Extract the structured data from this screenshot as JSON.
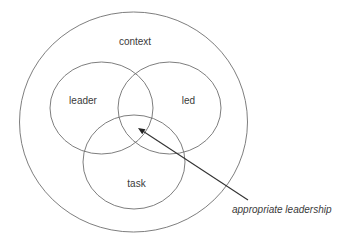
{
  "diagram": {
    "type": "venn",
    "colors": {
      "stroke": "#6f6f6f",
      "text": "#3a3a3a",
      "arrow": "#333333",
      "background": "#ffffff"
    },
    "outer": {
      "label": "context",
      "cx": 133.5,
      "cy": 122,
      "rx": 114,
      "ry": 110,
      "label_x": 135,
      "label_y": 45
    },
    "sets": [
      {
        "label": "leader",
        "cx": 101.5,
        "cy": 108,
        "rx": 51.5,
        "ry": 46,
        "label_x": 83,
        "label_y": 104
      },
      {
        "label": "led",
        "cx": 169.5,
        "cy": 108,
        "rx": 51.5,
        "ry": 46,
        "label_x": 188.5,
        "label_y": 104
      },
      {
        "label": "task",
        "cx": 134,
        "cy": 162,
        "rx": 51,
        "ry": 47,
        "label_x": 136.5,
        "label_y": 187
      }
    ],
    "annotation": {
      "label": "appropriate leadership",
      "arrow_from": [
        248,
        200
      ],
      "arrow_to": [
        138,
        128
      ],
      "label_x": 232,
      "label_y": 213
    }
  }
}
